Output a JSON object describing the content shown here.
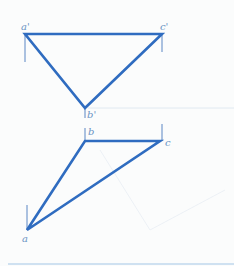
{
  "diagram": {
    "type": "orthographic-projection",
    "colors": {
      "edge": "#2f6cc0",
      "projection_tick": "#5a86c4",
      "construction": "#c9d8ea",
      "label": "#6b94c4",
      "bottom_rule": "#cfe1f1"
    },
    "upper_view": {
      "name": "front-view",
      "points": [
        {
          "id": "a_prime",
          "label": "a'",
          "x": 25,
          "y": 34
        },
        {
          "id": "c_prime",
          "label": "c'",
          "x": 162,
          "y": 34
        },
        {
          "id": "b_prime",
          "label": "b'",
          "x": 85,
          "y": 108
        }
      ]
    },
    "lower_view": {
      "name": "top-view",
      "points": [
        {
          "id": "b",
          "label": "b",
          "x": 85,
          "y": 141
        },
        {
          "id": "c",
          "label": "c",
          "x": 160,
          "y": 141
        },
        {
          "id": "a",
          "label": "a",
          "x": 27,
          "y": 230
        }
      ]
    },
    "labels": {
      "a_prime": "a'",
      "c_prime": "c'",
      "b_prime": "b'",
      "b": "b",
      "c": "c",
      "a": "a"
    }
  }
}
